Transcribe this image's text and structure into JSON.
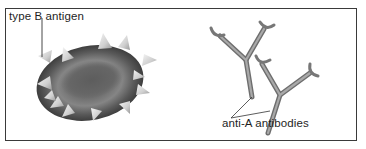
{
  "diagram": {
    "panels": [
      {
        "id": "red-blood-cell",
        "description": "Red blood cell with surface antigens",
        "label": "type B antigen",
        "antigen_count": 13
      },
      {
        "id": "antibodies",
        "description": "Two Y-shaped antibodies",
        "label": "anti-A antibodies",
        "antibody_count": 2
      }
    ],
    "colors": {
      "cell_dark": "#3e3e3e",
      "cell_mid": "#6a6a6a",
      "antigen": "#d8d8d8",
      "antibody": "#8a8a8a",
      "line": "#333333",
      "border": "#3a3a3a"
    }
  }
}
